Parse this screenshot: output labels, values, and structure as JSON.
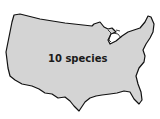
{
  "map": {
    "region": "United States (contiguous)",
    "fill_color": "#d4d4d4",
    "outline_color": "#111111",
    "label": "10 species"
  }
}
